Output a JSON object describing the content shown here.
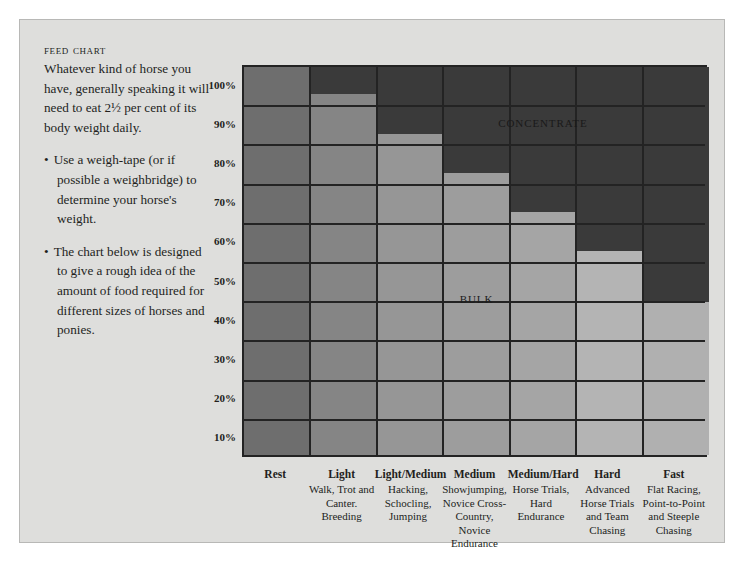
{
  "document": {
    "title": "Feed Chart",
    "intro": "Whatever kind of horse you have, generally speaking it will need to eat 2½ per cent of its body weight daily.",
    "bullets": [
      "Use a weigh-tape (or if possible a weighbridge) to determine your horse's weight.",
      "The chart below is designed to give a rough idea of the amount of food required for different sizes of horses and ponies."
    ],
    "bullet_marker": "•"
  },
  "chart_data": {
    "type": "bar",
    "title": "Feed Chart",
    "xlabel": "",
    "ylabel": "",
    "ylim": [
      0,
      100
    ],
    "grid": true,
    "legend_position": "in-plot",
    "yticks": [
      "100%",
      "90%",
      "80%",
      "70%",
      "60%",
      "50%",
      "40%",
      "30%",
      "20%",
      "10%"
    ],
    "ytick_values": [
      100,
      90,
      80,
      70,
      60,
      50,
      40,
      30,
      20,
      10
    ],
    "categories": [
      "Rest",
      "Light",
      "Light/Medium",
      "Medium",
      "Medium/Hard",
      "Hard",
      "Fast"
    ],
    "category_descriptions": [
      "",
      "Walk, Trot and Canter. Breeding",
      "Hacking, Schocling, Jumping",
      "Showjumping, Novice Cross-Country, Novice Endurance",
      "Horse Trials, Hard Endurance",
      "Advanced Horse Trials and Team Chasing",
      "Flat Racing, Point-to-Point and Steeple Chasing"
    ],
    "series": [
      {
        "name": "Bulk",
        "values": [
          100,
          93,
          83,
          73,
          63,
          53,
          40
        ],
        "colors": [
          "#6e6e6e",
          "#858585",
          "#969696",
          "#9d9d9d",
          "#a5a5a5",
          "#b4b4b4",
          "#b0b0b0"
        ]
      },
      {
        "name": "Concentrate",
        "values": [
          0,
          7,
          17,
          27,
          37,
          47,
          60
        ],
        "color": "#3a3a3a"
      }
    ],
    "annotations": [
      {
        "text": "Concentrate",
        "x_category": "Medium/Hard",
        "y": 86
      },
      {
        "text": "Bulk",
        "x_category": "Medium",
        "y": 41
      }
    ]
  },
  "colors": {
    "page_background": "#dededc",
    "grid_line": "#232323",
    "concentrate": "#3a3a3a",
    "text": "#231f1c"
  }
}
